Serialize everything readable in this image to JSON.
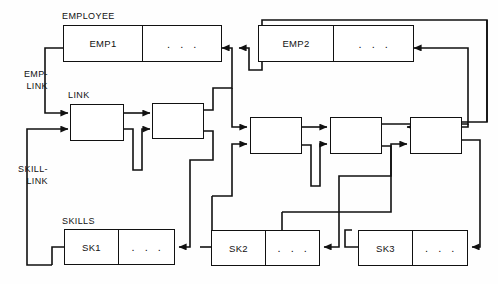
{
  "diagram": {
    "stroke_color": "#111111",
    "background_color": "#fefefe",
    "captions": {
      "employee": "EMPLOYEE",
      "link": "LINK",
      "skills": "SKILLS"
    },
    "side_labels": {
      "emp_link_line1": "EMP-",
      "emp_link_line2": "LINK",
      "skill_link_line1": "SKILL-",
      "skill_link_line2": "LINK"
    },
    "ellipsis": ". . .",
    "employee_records": [
      {
        "name": "EMP1",
        "data": ". . ."
      },
      {
        "name": "EMP2",
        "data": ". . ."
      }
    ],
    "skill_records": [
      {
        "name": "SK1",
        "data": ". . ."
      },
      {
        "name": "SK2",
        "data": ". . ."
      },
      {
        "name": "SK3",
        "data": ". . ."
      }
    ],
    "link_records": [
      {
        "id": "link-1"
      },
      {
        "id": "link-2"
      },
      {
        "id": "link-3"
      },
      {
        "id": "link-4"
      },
      {
        "id": "link-5"
      }
    ]
  }
}
